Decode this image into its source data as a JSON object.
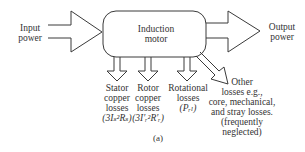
{
  "diagram": {
    "input": {
      "lines": [
        "Input",
        "power"
      ]
    },
    "output": {
      "lines": [
        "Output",
        "power"
      ]
    },
    "motor": {
      "lines": [
        "Induction",
        "motor"
      ]
    },
    "losses": [
      {
        "id": "stator",
        "lines": [
          "Stator",
          "copper",
          "losses"
        ],
        "formula": "(3Iₛ²Rₛ)"
      },
      {
        "id": "rotor",
        "lines": [
          "Rotor",
          "copper",
          "losses"
        ],
        "formula": "(3I′ᵣ²R′ᵣ)"
      },
      {
        "id": "rotational",
        "lines": [
          "Rotational",
          "losses"
        ],
        "formula": "(Pᵣₗ)"
      },
      {
        "id": "other",
        "lines": [
          "Other",
          "losses e.g.,",
          "core, mechanical,",
          "and stray losses.",
          "(frequently",
          "neglected)"
        ]
      }
    ],
    "caption": "(a)",
    "colors": {
      "stroke": "#3a3a3a",
      "background": "#ffffff"
    }
  }
}
